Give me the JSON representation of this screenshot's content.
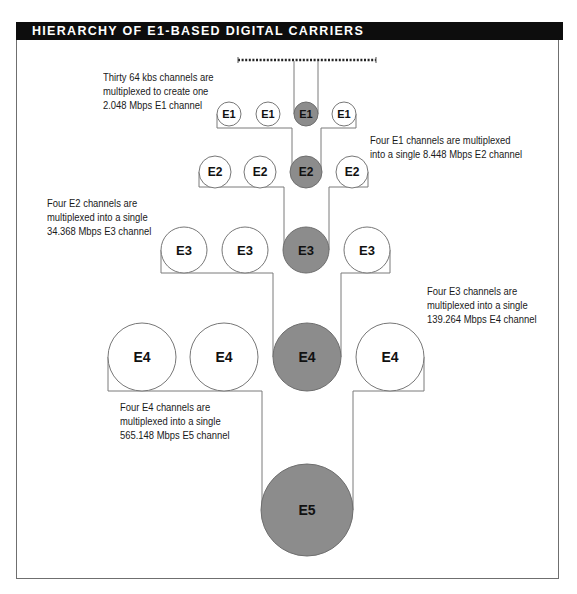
{
  "header": {
    "title": "HIERARCHY OF E1-BASED DIGITAL CARRIERS"
  },
  "colors": {
    "header_bg": "#0d0d0d",
    "highlight_fill": "#8c8c8c",
    "plain_fill": "#ffffff",
    "line": "#7a7a7a"
  },
  "levels": [
    {
      "id": "E1",
      "circles": [
        "E1",
        "E1",
        "E1",
        "E1"
      ],
      "highlighted_index": 2
    },
    {
      "id": "E2",
      "circles": [
        "E2",
        "E2",
        "E2",
        "E2"
      ],
      "highlighted_index": 2
    },
    {
      "id": "E3",
      "circles": [
        "E3",
        "E3",
        "E3",
        "E3"
      ],
      "highlighted_index": 2
    },
    {
      "id": "E4",
      "circles": [
        "E4",
        "E4",
        "E4",
        "E4"
      ],
      "highlighted_index": 2
    },
    {
      "id": "E5",
      "circles": [
        "E5"
      ],
      "highlighted_index": 0
    }
  ],
  "notes": [
    {
      "id": "e1",
      "lines": [
        "Thirty 64 kbs channels are",
        "multiplexed to create one",
        "2.048 Mbps E1 channel"
      ]
    },
    {
      "id": "e2",
      "lines": [
        "Four E1 channels are multiplexed",
        "into a single 8.448 Mbps E2 channel"
      ]
    },
    {
      "id": "e3",
      "lines": [
        "Four E2 channels are",
        "multiplexed into a single",
        "34.368 Mbps E3 channel"
      ]
    },
    {
      "id": "e4",
      "lines": [
        "Four E3 channels are",
        "multiplexed into a single",
        "139.264 Mbps E4 channel"
      ]
    },
    {
      "id": "e5",
      "lines": [
        "Four E4 channels are",
        "multiplexed into a single",
        "565.148 Mbps E5 channel"
      ]
    }
  ]
}
